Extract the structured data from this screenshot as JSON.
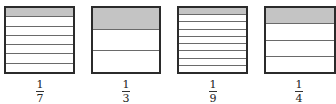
{
  "figures": [
    {
      "numerator": "1",
      "denominator": "7",
      "parts": 7,
      "shaded": 1
    },
    {
      "numerator": "1",
      "denominator": "3",
      "parts": 3,
      "shaded": 1
    },
    {
      "numerator": "1",
      "denominator": "9",
      "parts": 9,
      "shaded": 1
    },
    {
      "numerator": "1",
      "denominator": "4",
      "parts": 4,
      "shaded": 1
    }
  ],
  "colors": {
    "shaded": "#c4c4c4",
    "border": "#2b2b2b"
  }
}
